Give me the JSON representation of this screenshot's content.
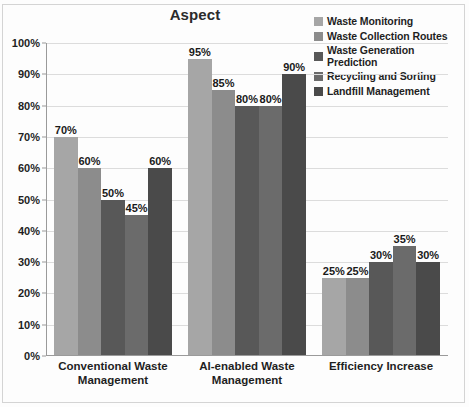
{
  "chart_data": {
    "type": "bar",
    "title": "Aspect",
    "xlabel": "",
    "ylabel": "",
    "ylim": [
      0,
      100
    ],
    "ytick_labels": [
      "100%",
      "90%",
      "80%",
      "70%",
      "60%",
      "50%",
      "40%",
      "30%",
      "20%",
      "10%",
      "0%"
    ],
    "ytick_values": [
      100,
      90,
      80,
      70,
      60,
      50,
      40,
      30,
      20,
      10,
      0
    ],
    "grid": true,
    "legend_position": "right",
    "value_labels": true,
    "value_label_suffix": "%",
    "categories": [
      "Conventional Waste Management",
      "AI-enabled Waste Management",
      "Efficiency Increase"
    ],
    "series": [
      {
        "name": "Waste Monitoring",
        "color": "#a6a6a6",
        "values": [
          70,
          95,
          25
        ],
        "labels": [
          "70%",
          "95%",
          "25%"
        ]
      },
      {
        "name": "Waste Collection Routes",
        "color": "#8c8c8c",
        "values": [
          60,
          85,
          25
        ],
        "labels": [
          "60%",
          "85%",
          "25%"
        ]
      },
      {
        "name": "Waste Generation Prediction",
        "color": "#585858",
        "values": [
          50,
          80,
          30
        ],
        "labels": [
          "50%",
          "80%",
          "30%"
        ]
      },
      {
        "name": "Recycling and Sorting",
        "color": "#6b6b6b",
        "values": [
          45,
          80,
          35
        ],
        "labels": [
          "45%",
          "80%",
          "35%"
        ]
      },
      {
        "name": "Landfill Management",
        "color": "#4a4a4a",
        "values": [
          60,
          90,
          30
        ],
        "labels": [
          "60%",
          "90%",
          "30%"
        ]
      }
    ]
  },
  "colors": {
    "background": "#fdfdfd",
    "grid": "#dcdcdc",
    "axis": "#9a9a9a",
    "text": "#1f1f1f",
    "title": "#2b2b2b"
  }
}
